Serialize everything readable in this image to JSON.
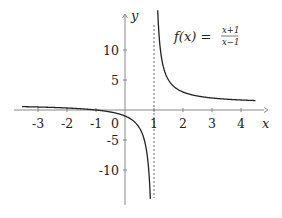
{
  "chart_data": {
    "type": "line",
    "title_parts": {
      "lhs": "f(x) =",
      "numerator": "x+1",
      "denominator": "x−1"
    },
    "xlabel": "x",
    "ylabel": "y",
    "xlim": [
      -3.6,
      4.8
    ],
    "ylim": [
      -15.8,
      16
    ],
    "x_ticks": [
      -3,
      -2,
      -1,
      0,
      1,
      2,
      3,
      4
    ],
    "x_tick_labels": [
      "-3",
      "-2",
      "-1",
      "0",
      "1",
      "2",
      "3",
      "4"
    ],
    "y_ticks": [
      10,
      5,
      -5,
      -10
    ],
    "y_tick_labels": [
      "10",
      "5",
      "-5",
      "-10"
    ],
    "grid": false,
    "asymptotes": {
      "vertical": 1,
      "horizontal": 1,
      "vertical_style": "dashed"
    },
    "series": [
      {
        "name": "left branch",
        "x": [
          -3.5,
          -3,
          -2,
          -1,
          0,
          0.5,
          0.75,
          0.875
        ],
        "y": [
          0.56,
          0.5,
          0.33,
          0,
          -1,
          -3,
          -7,
          -15
        ]
      },
      {
        "name": "right branch",
        "x": [
          1.125,
          1.25,
          1.5,
          2,
          3,
          4,
          4.5
        ],
        "y": [
          17,
          9,
          5,
          3,
          2,
          1.67,
          1.57
        ]
      }
    ]
  }
}
